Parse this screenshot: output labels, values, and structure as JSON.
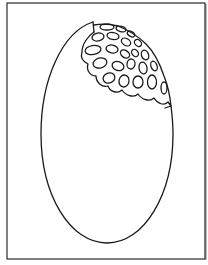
{
  "page": {
    "kind": "coloring-page",
    "background": "#ffffff",
    "ink": "#1a1a1a"
  },
  "frame": {
    "x": 7,
    "y": 3,
    "width": 198,
    "height": 256
  },
  "oval": {
    "cx": 107,
    "cy": 134,
    "rx": 66,
    "ry": 109
  },
  "petal_cluster": {
    "position": "upper-right of oval",
    "rows": 5
  }
}
